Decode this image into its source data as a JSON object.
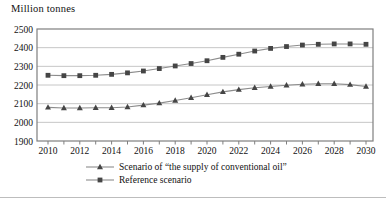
{
  "figure": {
    "unit_label": "Million tonnes"
  },
  "legend": {
    "items": [
      {
        "label": "Scenario of “the supply of conventional oil”",
        "marker": "triangle"
      },
      {
        "label": "Reference scenario",
        "marker": "square"
      }
    ]
  },
  "chart_data": {
    "type": "line",
    "title": "",
    "xlabel": "",
    "ylabel": "Million tonnes",
    "ylim": [
      1900,
      2500
    ],
    "ytick_step": 100,
    "xtick_label_step": 2,
    "grid": "horizontal",
    "legend_position": "bottom",
    "x": [
      2010,
      2011,
      2012,
      2013,
      2014,
      2015,
      2016,
      2017,
      2018,
      2019,
      2020,
      2021,
      2022,
      2023,
      2024,
      2025,
      2026,
      2027,
      2028,
      2029,
      2030
    ],
    "series": [
      {
        "name": "Scenario of “the supply of conventional oil”",
        "marker": "triangle",
        "values": [
          2080,
          2077,
          2077,
          2078,
          2078,
          2082,
          2092,
          2103,
          2117,
          2132,
          2148,
          2163,
          2175,
          2185,
          2192,
          2199,
          2204,
          2207,
          2207,
          2202,
          2192
        ]
      },
      {
        "name": "Reference scenario",
        "marker": "square",
        "values": [
          2252,
          2250,
          2250,
          2252,
          2257,
          2265,
          2275,
          2288,
          2302,
          2315,
          2330,
          2348,
          2365,
          2382,
          2396,
          2406,
          2414,
          2418,
          2420,
          2420,
          2418
        ]
      }
    ],
    "colors": {
      "line": "#8c8c8c",
      "marker": "#454545",
      "grid": "#c6c6c6",
      "frame": "#7f7f7f",
      "text": "#111111"
    }
  }
}
